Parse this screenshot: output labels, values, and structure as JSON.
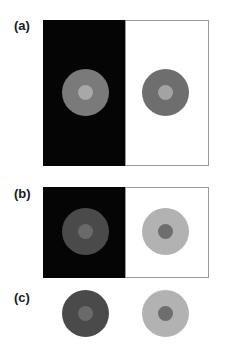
{
  "figure": {
    "panels": [
      {
        "label": "(a)",
        "left_background": "#050505",
        "right_background": "#ffffff",
        "left_circle": {
          "outer": "#7a7a7a",
          "inner": "#a8a8a8"
        },
        "right_circle": {
          "outer": "#6e6e6e",
          "inner": "#a3a3a3"
        }
      },
      {
        "label": "(b)",
        "left_background": "#050505",
        "right_background": "#ffffff",
        "left_circle": {
          "outer": "#4a4a4a",
          "inner": "#6a6a6a"
        },
        "right_circle": {
          "outer": "#b2b2b2",
          "inner": "#6e6e6e"
        }
      },
      {
        "label": "(c)",
        "left_circle": {
          "outer": "#4a4a4a",
          "inner": "#6a6a6a"
        },
        "right_circle": {
          "outer": "#b2b2b2",
          "inner": "#6e6e6e"
        }
      }
    ],
    "border_color": "#9a9a9a"
  }
}
